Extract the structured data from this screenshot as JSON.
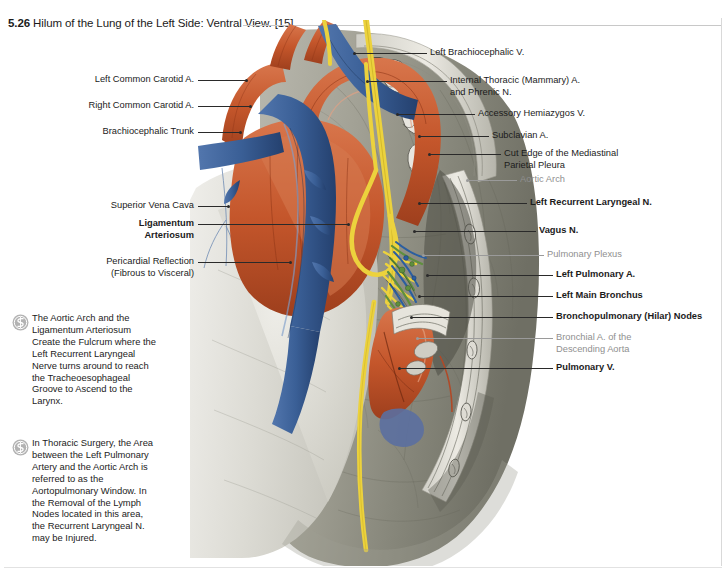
{
  "title": {
    "number": "5.26",
    "text": "Hilum of the Lung of the Left Side: Ventral View. [15]"
  },
  "labels_left": [
    {
      "id": "left-common-carotid-a",
      "text": "Left Common Carotid A.",
      "bold": false,
      "gray": false
    },
    {
      "id": "right-common-carotid-a",
      "text": "Right Common Carotid A.",
      "bold": false,
      "gray": false
    },
    {
      "id": "brachiocephalic-trunk",
      "text": "Brachiocephalic Trunk",
      "bold": false,
      "gray": false
    },
    {
      "id": "superior-vena-cava",
      "text": "Superior Vena Cava",
      "bold": false,
      "gray": false
    },
    {
      "id": "ligamentum-arteriosum",
      "text": "Ligamentum\nArteriosum",
      "bold": true,
      "gray": false
    },
    {
      "id": "pericardial-reflection",
      "text": "Pericardial Reflection\n(Fibrous to Visceral)",
      "bold": false,
      "gray": false
    }
  ],
  "labels_right": [
    {
      "id": "left-brachiocephalic-v",
      "text": "Left Brachiocephalic V.",
      "bold": false,
      "gray": false
    },
    {
      "id": "internal-thoracic-a-phrenic-n",
      "text": "Internal Thoracic (Mammary) A.\nand Phrenic N.",
      "bold": false,
      "gray": false
    },
    {
      "id": "accessory-hemiazygos-v",
      "text": "Accessory Hemiazygos V.",
      "bold": false,
      "gray": false
    },
    {
      "id": "subclavian-a",
      "text": "Subclavian A.",
      "bold": false,
      "gray": false
    },
    {
      "id": "cut-edge-mediastinal-parietal-pleura",
      "text": "Cut Edge of the Mediastinal\nParietal Pleura",
      "bold": false,
      "gray": false
    },
    {
      "id": "aortic-arch",
      "text": "Aortic Arch",
      "bold": false,
      "gray": true
    },
    {
      "id": "left-recurrent-laryngeal-n",
      "text": "Left Recurrent Laryngeal N.",
      "bold": true,
      "gray": false
    },
    {
      "id": "vagus-n",
      "text": "Vagus N.",
      "bold": true,
      "gray": false
    },
    {
      "id": "pulmonary-plexus",
      "text": "Pulmonary Plexus",
      "bold": false,
      "gray": true
    },
    {
      "id": "left-pulmonary-a",
      "text": "Left Pulmonary A.",
      "bold": true,
      "gray": false
    },
    {
      "id": "left-main-bronchus",
      "text": "Left Main Bronchus",
      "bold": true,
      "gray": false
    },
    {
      "id": "bronchopulmonary-hilar-nodes",
      "text": "Bronchopulmonary (Hilar) Nodes",
      "bold": true,
      "gray": false
    },
    {
      "id": "bronchial-a-descending-aorta",
      "text": "Bronchial A. of the\nDescending Aorta",
      "bold": false,
      "gray": true
    },
    {
      "id": "pulmonary-v",
      "text": "Pulmonary V.",
      "bold": true,
      "gray": false
    }
  ],
  "notes": [
    {
      "id": "note-aortic-arch-fulcrum",
      "icon": "clinical-note-icon",
      "text": "The Aortic Arch and the Ligamentum Arteriosum Create the Fulcrum where the Left Recurrent Laryngeal Nerve turns around to reach the Tracheoesophageal Groove to Ascend to the Larynx."
    },
    {
      "id": "note-aortopulmonary-window",
      "icon": "clinical-note-icon",
      "text": "In Thoracic Surgery, the Area between the Left Pulmonary Artery and the Aortic Arch is referred to as the Aortopulmonary Window.  In the Removal of the Lymph Nodes located in this area, the Recurrent Laryngeal N. may be Injured."
    }
  ],
  "colors": {
    "artery": "#c4562b",
    "vein": "#3a5f96",
    "nerve": "#ecd23d",
    "lung": "#8d8d82",
    "pericardium": "#d7d6d0",
    "plexus_green": "#5f8f3e",
    "label_gray": "#8f8f8f"
  }
}
